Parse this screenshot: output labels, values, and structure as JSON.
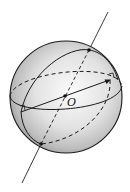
{
  "diagram": {
    "type": "sphere",
    "labels": {
      "center": "O"
    },
    "colors": {
      "stroke": "#1a1a1a",
      "sphere_light": "#f4f4f4",
      "sphere_dark": "#9a9a9a"
    },
    "points": [
      {
        "name": "north-pole",
        "x": 89,
        "y": 50
      },
      {
        "name": "south-pole",
        "x": 41,
        "y": 144
      },
      {
        "name": "center",
        "x": 65,
        "y": 96
      },
      {
        "name": "diameter-left",
        "x": 21,
        "y": 112
      },
      {
        "name": "diameter-right",
        "x": 110,
        "y": 80
      }
    ]
  }
}
